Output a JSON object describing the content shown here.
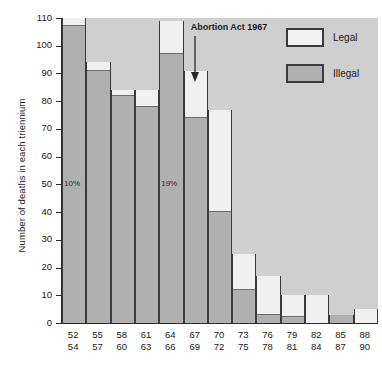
{
  "chart_data": {
    "type": "bar",
    "subtype": "stacked-bar",
    "title": "",
    "xlabel": "",
    "ylabel": "Number of deaths in each triennium",
    "ylim": [
      0,
      110
    ],
    "ytick_step": 10,
    "yticks": [
      0,
      10,
      20,
      30,
      40,
      50,
      60,
      70,
      80,
      90,
      100,
      110
    ],
    "grid": false,
    "legend_position": "top-right",
    "categories": [
      "52\n54",
      "55\n57",
      "58\n60",
      "61\n63",
      "64\n66",
      "67\n69",
      "70\n72",
      "73\n75",
      "76\n78",
      "79\n81",
      "82\n84",
      "85\n87",
      "88\n90"
    ],
    "category_lines": [
      [
        "52",
        "54"
      ],
      [
        "55",
        "57"
      ],
      [
        "58",
        "60"
      ],
      [
        "61",
        "63"
      ],
      [
        "64",
        "66"
      ],
      [
        "67",
        "69"
      ],
      [
        "70",
        "72"
      ],
      [
        "73",
        "75"
      ],
      [
        "76",
        "78"
      ],
      [
        "79",
        "81"
      ],
      [
        "82",
        "84"
      ],
      [
        "85",
        "87"
      ],
      [
        "88",
        "90"
      ]
    ],
    "series": [
      {
        "name": "Illegal",
        "color": "#b0b0b0",
        "values": [
          107,
          91,
          82,
          78,
          97,
          74,
          40,
          12,
          3,
          2,
          0,
          3,
          0
        ]
      },
      {
        "name": "Legal",
        "color": "#f0f0f0",
        "values": [
          3,
          3,
          2,
          6,
          12,
          17,
          37,
          13,
          14,
          8,
          10,
          0,
          5
        ]
      }
    ],
    "totals": [
      110,
      94,
      84,
      84,
      109,
      91,
      77,
      25,
      17,
      10,
      10,
      3,
      5
    ],
    "annotations": [
      {
        "text": "10%",
        "category": "52\n54",
        "value": 50
      },
      {
        "text": "19%",
        "category": "64\n66",
        "value": 50
      },
      {
        "text": "Abortion Act 1967",
        "category": "67\n69",
        "arrow": "down"
      }
    ]
  },
  "legend": {
    "items": [
      {
        "label": "Legal",
        "swatch": "legal-swatch"
      },
      {
        "label": "Illegal",
        "swatch": "illegal-swatch"
      }
    ]
  },
  "axis": {
    "y_title": "Number of deaths in each triennium",
    "y_tick_labels": [
      "110",
      "100",
      "90",
      "80",
      "70",
      "60",
      "50",
      "40",
      "30",
      "20",
      "10",
      "0"
    ]
  },
  "annotations": {
    "act_label": "Abortion Act 1967",
    "pct_first": "10%",
    "pct_second": "19%"
  },
  "colors": {
    "plot_background": "#cfcfcf",
    "illegal_fill": "#b0b0b0",
    "legal_fill": "#f0f0f0",
    "bar_outline": "#3a3a3a",
    "axis": "#2b2b2b"
  }
}
